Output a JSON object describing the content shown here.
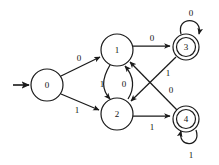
{
  "diagram": {
    "kind": "finite-state-automaton",
    "title": "",
    "colors": {
      "stroke": "#1a1a1a",
      "fill": "#ffffff",
      "text": "#111111"
    },
    "start_state": "0",
    "accepting_states": [
      "3",
      "4"
    ],
    "alphabet": [
      "0",
      "1"
    ],
    "states": [
      {
        "id": "s0",
        "label": "0",
        "x": 47,
        "y": 85,
        "r": 16,
        "accepting": false,
        "start": true
      },
      {
        "id": "s1",
        "label": "1",
        "x": 117,
        "y": 50,
        "r": 16,
        "accepting": false,
        "start": false
      },
      {
        "id": "s2",
        "label": "2",
        "x": 117,
        "y": 114,
        "r": 16,
        "accepting": false,
        "start": false
      },
      {
        "id": "s3",
        "label": "3",
        "x": 186,
        "y": 47,
        "r": 13,
        "accepting": true,
        "start": false
      },
      {
        "id": "s4",
        "label": "4",
        "x": 186,
        "y": 119,
        "r": 13,
        "accepting": true,
        "start": false
      }
    ],
    "transitions": [
      {
        "id": "t0",
        "from": "0",
        "to": "1",
        "symbol": "0",
        "label_x": 79,
        "label_y": 58
      },
      {
        "id": "t1",
        "from": "0",
        "to": "2",
        "symbol": "1",
        "label_x": 77,
        "label_y": 110
      },
      {
        "id": "t2",
        "from": "1",
        "to": "2",
        "symbol": "1",
        "label_x": 102,
        "label_y": 84
      },
      {
        "id": "t3",
        "from": "2",
        "to": "1",
        "symbol": "0",
        "label_x": 124,
        "label_y": 84
      },
      {
        "id": "t4",
        "from": "1",
        "to": "3",
        "symbol": "0",
        "label_x": 152,
        "label_y": 38
      },
      {
        "id": "t5",
        "from": "2",
        "to": "4",
        "symbol": "1",
        "label_x": 152,
        "label_y": 127
      },
      {
        "id": "t6",
        "from": "3",
        "to": "2",
        "symbol": "1",
        "label_x": 168,
        "label_y": 73
      },
      {
        "id": "t7",
        "from": "4",
        "to": "1",
        "symbol": "0",
        "label_x": 171,
        "label_y": 90
      },
      {
        "id": "t8",
        "from": "3",
        "to": "3",
        "symbol": "0",
        "label_x": 191,
        "label_y": 13
      },
      {
        "id": "t9",
        "from": "4",
        "to": "4",
        "symbol": "1",
        "label_x": 191,
        "label_y": 155
      }
    ]
  }
}
